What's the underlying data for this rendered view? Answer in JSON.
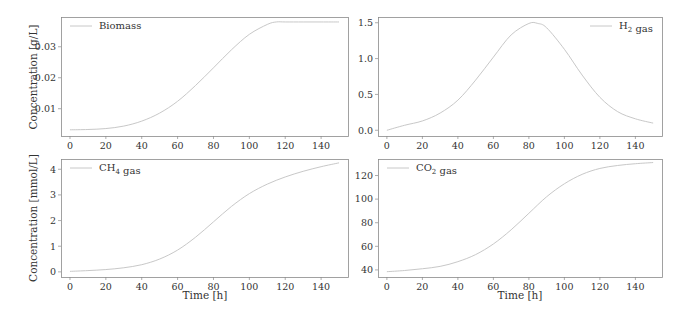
{
  "figure": {
    "ylabel_top": "Concentration [g/L]",
    "ylabel_bottom": "Concentration [mmol/L]",
    "xlabel": "Time [h]",
    "line_color": "#c8c8c8",
    "axis_color": "#8a8a8a"
  },
  "chart_data": [
    {
      "type": "line",
      "panel": "top-left",
      "title": "",
      "legend": [
        "Biomass"
      ],
      "legend_position": "upper left",
      "xlabel": "",
      "ylabel": "Concentration [g/L]",
      "xlim": [
        -5,
        155
      ],
      "ylim": [
        0.0012,
        0.0396
      ],
      "xticks": [
        0,
        20,
        40,
        60,
        80,
        100,
        120,
        140
      ],
      "yticks": [
        0.01,
        0.02,
        0.03
      ],
      "ytick_labels": [
        "0.01",
        "0.02",
        "0.03"
      ],
      "x": [
        0,
        10,
        20,
        30,
        40,
        50,
        60,
        70,
        80,
        90,
        100,
        110,
        115,
        120,
        130,
        140,
        150
      ],
      "series": [
        {
          "name": "Biomass",
          "values": [
            0.0032,
            0.0033,
            0.0036,
            0.0044,
            0.006,
            0.0086,
            0.0124,
            0.0175,
            0.0232,
            0.029,
            0.034,
            0.0372,
            0.038,
            0.038,
            0.038,
            0.038,
            0.038
          ]
        }
      ]
    },
    {
      "type": "line",
      "panel": "top-right",
      "title": "",
      "legend": [
        "H2 gas"
      ],
      "legend_position": "upper right",
      "xlabel": "",
      "ylabel": "",
      "xlim": [
        -5,
        155
      ],
      "ylim": [
        -0.08,
        1.58
      ],
      "xticks": [
        0,
        20,
        40,
        60,
        80,
        100,
        120,
        140
      ],
      "yticks": [
        0.0,
        0.5,
        1.0,
        1.5
      ],
      "ytick_labels": [
        "0.0",
        "0.5",
        "1.0",
        "1.5"
      ],
      "x": [
        0,
        10,
        20,
        30,
        40,
        50,
        60,
        70,
        80,
        85,
        90,
        100,
        110,
        120,
        130,
        140,
        150
      ],
      "series": [
        {
          "name": "H2 gas",
          "values": [
            0.0,
            0.07,
            0.13,
            0.24,
            0.42,
            0.7,
            1.02,
            1.33,
            1.49,
            1.49,
            1.43,
            1.13,
            0.77,
            0.46,
            0.26,
            0.16,
            0.1
          ]
        }
      ]
    },
    {
      "type": "line",
      "panel": "bottom-left",
      "title": "",
      "legend": [
        "CH4 gas"
      ],
      "legend_position": "upper left",
      "xlabel": "Time [h]",
      "ylabel": "Concentration [mmol/L]",
      "xlim": [
        -5,
        155
      ],
      "ylim": [
        -0.2,
        4.4
      ],
      "xticks": [
        0,
        20,
        40,
        60,
        80,
        100,
        120,
        140
      ],
      "yticks": [
        0,
        1,
        2,
        3,
        4
      ],
      "ytick_labels": [
        "0",
        "1",
        "2",
        "3",
        "4"
      ],
      "x": [
        0,
        10,
        20,
        30,
        40,
        50,
        60,
        70,
        80,
        90,
        100,
        110,
        120,
        130,
        140,
        150
      ],
      "series": [
        {
          "name": "CH4 gas",
          "values": [
            0.02,
            0.05,
            0.09,
            0.16,
            0.28,
            0.5,
            0.85,
            1.35,
            1.95,
            2.55,
            3.05,
            3.42,
            3.7,
            3.92,
            4.1,
            4.25
          ]
        }
      ]
    },
    {
      "type": "line",
      "panel": "bottom-right",
      "title": "",
      "legend": [
        "CO2 gas"
      ],
      "legend_position": "upper left",
      "xlabel": "Time [h]",
      "ylabel": "",
      "xlim": [
        -5,
        155
      ],
      "ylim": [
        34,
        134
      ],
      "xticks": [
        0,
        20,
        40,
        60,
        80,
        100,
        120,
        140
      ],
      "yticks": [
        40,
        60,
        80,
        100,
        120
      ],
      "ytick_labels": [
        "40",
        "60",
        "80",
        "100",
        "120"
      ],
      "x": [
        0,
        10,
        20,
        30,
        40,
        50,
        60,
        70,
        80,
        90,
        100,
        110,
        120,
        130,
        140,
        150
      ],
      "series": [
        {
          "name": "CO2 gas",
          "values": [
            38.5,
            39.5,
            41,
            43,
            47,
            53,
            62,
            74,
            88,
            102,
            113,
            121,
            126,
            128.5,
            130,
            131
          ]
        }
      ]
    }
  ]
}
